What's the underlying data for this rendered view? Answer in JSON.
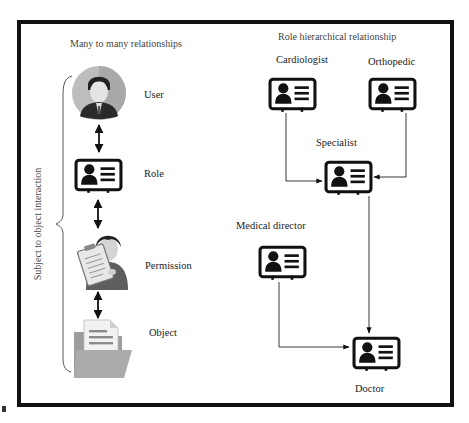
{
  "left_panel": {
    "title": "Many to many relationships",
    "side_label": "Subject to object interaction",
    "nodes": [
      {
        "label": "User",
        "icon": "user-avatar-icon"
      },
      {
        "label": "Role",
        "icon": "id-card-icon"
      },
      {
        "label": "Permission",
        "icon": "person-clipboard-icon"
      },
      {
        "label": "Object",
        "icon": "folder-document-icon"
      }
    ],
    "connectors": [
      "bidirectional-arrow",
      "bidirectional-arrow",
      "bidirectional-arrow"
    ]
  },
  "right_panel": {
    "title": "Role hierarchical relationship",
    "roles": [
      {
        "label": "Cardiologist",
        "icon": "id-card-icon"
      },
      {
        "label": "Orthopedic",
        "icon": "id-card-icon"
      },
      {
        "label": "Specialist",
        "icon": "id-card-icon"
      },
      {
        "label": "Medical director",
        "icon": "id-card-icon"
      },
      {
        "label": "Doctor",
        "icon": "id-card-icon"
      }
    ],
    "edges": [
      {
        "from": "Cardiologist",
        "to": "Specialist"
      },
      {
        "from": "Orthopedic",
        "to": "Specialist"
      },
      {
        "from": "Specialist",
        "to": "Doctor"
      },
      {
        "from": "Medical director",
        "to": "Doctor"
      }
    ]
  },
  "colors": {
    "frame": "#111111",
    "icon": "#111111",
    "avatar_bg": "#b9b9b9",
    "folder": "#9a9a9a",
    "text": "#333333"
  }
}
